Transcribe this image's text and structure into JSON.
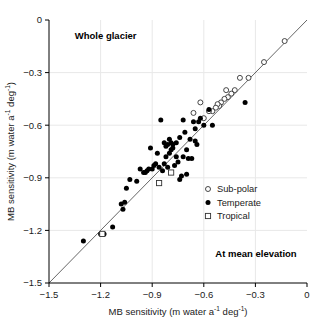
{
  "chart_data": {
    "type": "scatter",
    "title": "",
    "xlabel": "MB sensitivity (m water a⁻¹ deg⁻¹)",
    "ylabel": "MB sensitivity (m water a⁻¹ deg⁻¹)",
    "xlabel_parts": {
      "main": "MB sensitivity (m water a",
      "sup1": "-1",
      "mid": " deg",
      "sup2": "-1",
      "end": ")"
    },
    "ylabel_parts": {
      "main": "MB sensitivity (m water a",
      "sup1": "-1",
      "mid": " deg",
      "sup2": "-1",
      "end": ")"
    },
    "xlim": [
      -1.5,
      0
    ],
    "ylim": [
      -1.5,
      0
    ],
    "xticks": [
      -1.5,
      -1.2,
      -0.9,
      -0.6,
      -0.3,
      0
    ],
    "yticks": [
      -1.5,
      -1.2,
      -0.9,
      -0.6,
      -0.3,
      0
    ],
    "xticklabels": [
      "−1.5",
      "−1.2",
      "−0.9",
      "−0.6",
      "−0.3",
      "0"
    ],
    "yticklabels": [
      "−1.5",
      "−1.2",
      "−0.9",
      "−0.6",
      "−0.3",
      "0"
    ],
    "grid": true,
    "grid_color": "#e8e8e8",
    "reference_line": {
      "type": "1:1",
      "from": [
        -1.5,
        -1.5
      ],
      "to": [
        0,
        0
      ],
      "color": "#555555"
    },
    "annotations": [
      {
        "text": "Whole glacier",
        "x": -1.35,
        "y": -0.11,
        "bold": true,
        "align": "left"
      },
      {
        "text": "At mean elevation",
        "x": -0.06,
        "y": -1.35,
        "bold": true,
        "align": "right"
      }
    ],
    "legend": {
      "position": "lower right",
      "entries": [
        {
          "label": "Sub-polar",
          "marker": "open-circle",
          "color": "#333333"
        },
        {
          "label": "Temperate",
          "marker": "filled-circle",
          "color": "#000000"
        },
        {
          "label": "Tropical",
          "marker": "open-square",
          "color": "#333333"
        }
      ]
    },
    "series": [
      {
        "name": "Sub-polar",
        "marker": "open-circle",
        "points": [
          [
            -0.13,
            -0.12
          ],
          [
            -0.25,
            -0.24
          ],
          [
            -0.34,
            -0.33
          ],
          [
            -0.39,
            -0.33
          ],
          [
            -0.42,
            -0.4
          ],
          [
            -0.44,
            -0.42
          ],
          [
            -0.46,
            -0.44
          ],
          [
            -0.47,
            -0.4
          ],
          [
            -0.48,
            -0.45
          ],
          [
            -0.5,
            -0.47
          ],
          [
            -0.51,
            -0.49
          ],
          [
            -0.52,
            -0.48
          ],
          [
            -0.53,
            -0.5
          ],
          [
            -0.55,
            -0.52
          ],
          [
            -0.57,
            -0.52
          ],
          [
            -0.6,
            -0.56
          ],
          [
            -0.62,
            -0.47
          ],
          [
            -0.66,
            -0.53
          ]
        ]
      },
      {
        "name": "Temperate",
        "marker": "filled-circle",
        "points": [
          [
            -0.36,
            -0.47
          ],
          [
            -0.55,
            -0.6
          ],
          [
            -0.57,
            -0.51
          ],
          [
            -0.6,
            -0.6
          ],
          [
            -0.62,
            -0.56
          ],
          [
            -0.63,
            -0.58
          ],
          [
            -0.65,
            -0.62
          ],
          [
            -0.65,
            -0.69
          ],
          [
            -0.66,
            -0.58
          ],
          [
            -0.68,
            -0.68
          ],
          [
            -0.69,
            -0.79
          ],
          [
            -0.7,
            -0.74
          ],
          [
            -0.71,
            -0.64
          ],
          [
            -0.72,
            -0.57
          ],
          [
            -0.72,
            -0.78
          ],
          [
            -0.73,
            -0.89
          ],
          [
            -0.74,
            -0.67
          ],
          [
            -0.75,
            -0.81
          ],
          [
            -0.76,
            -0.7
          ],
          [
            -0.76,
            -0.78
          ],
          [
            -0.77,
            -0.83
          ],
          [
            -0.78,
            -0.71
          ],
          [
            -0.78,
            -0.73
          ],
          [
            -0.79,
            -0.7
          ],
          [
            -0.79,
            -0.74
          ],
          [
            -0.8,
            -0.68
          ],
          [
            -0.8,
            -0.76
          ],
          [
            -0.81,
            -0.71
          ],
          [
            -0.81,
            -0.84
          ],
          [
            -0.82,
            -0.72
          ],
          [
            -0.82,
            -0.78
          ],
          [
            -0.83,
            -0.7
          ],
          [
            -0.83,
            -0.82
          ],
          [
            -0.84,
            -0.86
          ],
          [
            -0.85,
            -0.57
          ],
          [
            -0.86,
            -0.84
          ],
          [
            -0.87,
            -0.76
          ],
          [
            -0.88,
            -0.82
          ],
          [
            -0.89,
            -0.83
          ],
          [
            -0.9,
            -0.85
          ],
          [
            -0.91,
            -0.73
          ],
          [
            -0.92,
            -0.85
          ],
          [
            -0.93,
            -0.86
          ],
          [
            -0.94,
            -0.87
          ],
          [
            -0.95,
            -0.87
          ],
          [
            -0.97,
            -0.85
          ],
          [
            -0.99,
            -0.92
          ],
          [
            -1.03,
            -0.91
          ],
          [
            -1.05,
            -0.96
          ],
          [
            -1.06,
            -1.04
          ],
          [
            -1.07,
            -1.08
          ],
          [
            -1.08,
            -1.05
          ],
          [
            -1.13,
            -1.18
          ],
          [
            -1.18,
            -1.22
          ],
          [
            -1.2,
            -1.22
          ],
          [
            -1.3,
            -1.26
          ],
          [
            -0.7,
            -0.88
          ],
          [
            -0.67,
            -0.79
          ],
          [
            -0.64,
            -0.71
          ],
          [
            -0.74,
            -0.91
          ]
        ]
      },
      {
        "name": "Tropical",
        "marker": "open-square",
        "points": [
          [
            -0.79,
            -0.87
          ],
          [
            -0.86,
            -0.93
          ],
          [
            -1.19,
            -1.22
          ]
        ]
      }
    ]
  }
}
